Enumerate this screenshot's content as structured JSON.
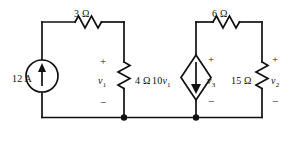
{
  "figure": {
    "type": "electrical-circuit-schematic",
    "width": 300,
    "height": 141,
    "background_color": "#ffffff",
    "line_color": "#111111"
  },
  "components": {
    "source_12a": {
      "label": "12 A",
      "kind": "independent-current-source",
      "symbol": "circle-with-up-arrow",
      "arrow_direction": "up"
    },
    "resistor_3": {
      "label": "3 Ω",
      "kind": "resistor",
      "orientation": "horizontal"
    },
    "resistor_4": {
      "label": "4 Ω",
      "kind": "resistor",
      "orientation": "vertical"
    },
    "resistor_6": {
      "label": "6 Ω",
      "kind": "resistor",
      "orientation": "horizontal"
    },
    "resistor_15": {
      "label": "15 Ω",
      "kind": "resistor",
      "orientation": "vertical"
    },
    "dependent_source": {
      "label_main": "10",
      "label_var": "v",
      "label_sub": "1",
      "kind": "dependent-current-source",
      "symbol": "diamond-with-down-arrow",
      "arrow_direction": "down"
    }
  },
  "node_voltages": {
    "v1": {
      "var": "v",
      "sub": "1",
      "plus": "+",
      "minus": "−"
    },
    "v2": {
      "var": "v",
      "sub": "2",
      "plus": "+",
      "minus": "−"
    },
    "v3": {
      "var": "v",
      "sub": "3",
      "plus": "+",
      "minus": "−"
    }
  }
}
